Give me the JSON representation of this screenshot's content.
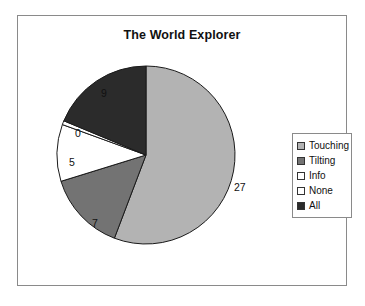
{
  "chart_data": {
    "type": "pie",
    "title": "The World Explorer",
    "categories": [
      "Touching",
      "Tilting",
      "Info",
      "None",
      "All"
    ],
    "values": [
      27,
      7,
      0,
      5,
      9
    ],
    "labels": [
      "27",
      "7",
      "0",
      "5",
      "9"
    ],
    "colors": [
      "#b3b3b3",
      "#737373",
      "#ffffff",
      "#ffffff",
      "#2b2b2b"
    ],
    "legend_position": "right",
    "grid": false,
    "xlabel": "",
    "ylabel": "",
    "start_angle_deg": 0,
    "direction": "clockwise",
    "slices": [
      {
        "name": "Touching",
        "value": 27,
        "label": "27",
        "color": "#b3b3b3",
        "start_deg": 0,
        "end_deg": 200.8,
        "label_x": 233,
        "label_y": 180
      },
      {
        "name": "Tilting",
        "value": 7,
        "label": "7",
        "color": "#737373",
        "start_deg": 200.8,
        "end_deg": 252.8,
        "label_x": 91,
        "label_y": 216
      },
      {
        "name": "None",
        "value": 5,
        "label": "5",
        "color": "#ffffff",
        "start_deg": 252.8,
        "end_deg": 290.0,
        "label_x": 68,
        "label_y": 155
      },
      {
        "name": "Info",
        "value": 0,
        "label": "0",
        "color": "#ffffff",
        "start_deg": 290.0,
        "end_deg": 292.6,
        "label_x": 74,
        "label_y": 126
      },
      {
        "name": "All",
        "value": 9,
        "label": "9",
        "color": "#2b2b2b",
        "start_deg": 292.6,
        "end_deg": 360.0,
        "label_x": 100,
        "label_y": 86
      }
    ]
  },
  "legend": {
    "items": [
      {
        "label": "Touching",
        "color": "#b3b3b3"
      },
      {
        "label": "Tilting",
        "color": "#737373"
      },
      {
        "label": "Info",
        "color": "#ffffff"
      },
      {
        "label": "None",
        "color": "#ffffff"
      },
      {
        "label": "All",
        "color": "#2b2b2b"
      }
    ]
  }
}
